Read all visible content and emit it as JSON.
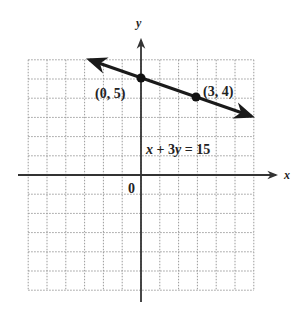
{
  "chart_data": {
    "type": "line",
    "title": "",
    "xlabel": "x",
    "ylabel": "y",
    "xlim": [
      -6,
      6
    ],
    "ylim": [
      -6,
      6
    ],
    "grid": true,
    "origin_label": "0",
    "series": [
      {
        "name": "x + 3y = 15",
        "equation": "x + 3y = 15",
        "x": [
          -3,
          6
        ],
        "y": [
          6,
          3
        ],
        "arrows": "both"
      }
    ],
    "points": [
      {
        "x": 0,
        "y": 5,
        "label": "(0, 5)"
      },
      {
        "x": 3,
        "y": 4,
        "label": "(3, 4)"
      }
    ],
    "annotations": [
      {
        "text": "x + 3y = 15",
        "x": 0.3,
        "y": 1.1
      }
    ]
  },
  "labels": {
    "x_axis": "x",
    "y_axis": "y",
    "origin": "0",
    "point_a": "(0, 5)",
    "point_b": "(3, 4)",
    "equation": "x + 3y = 15"
  },
  "colors": {
    "grid": "#9a9a9a",
    "axis": "#333333",
    "line": "#1a1a1a"
  }
}
